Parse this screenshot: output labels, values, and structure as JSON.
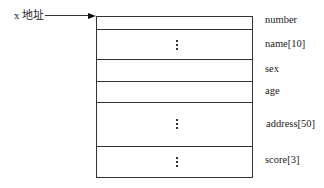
{
  "pointer": {
    "label": "x 地址"
  },
  "struct": {
    "fields": [
      {
        "name": "number",
        "has_ellipsis": false
      },
      {
        "name": "name[10]",
        "has_ellipsis": true
      },
      {
        "name": "sex",
        "has_ellipsis": false
      },
      {
        "name": "age",
        "has_ellipsis": false
      },
      {
        "name": "address[50]",
        "has_ellipsis": true
      },
      {
        "name": "score[3]",
        "has_ellipsis": true
      }
    ]
  }
}
